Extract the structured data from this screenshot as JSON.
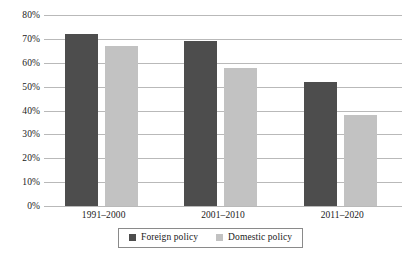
{
  "chart_data": {
    "type": "bar",
    "title": "",
    "subtitle": "",
    "xlabel": "",
    "ylabel": "",
    "categories": [
      "1991–2000",
      "2001–2010",
      "2011–2020"
    ],
    "series": [
      {
        "name": "Foreign policy",
        "values": [
          72,
          69,
          52
        ],
        "color": "#4d4d4d"
      },
      {
        "name": "Domestic policy",
        "values": [
          67,
          58,
          38
        ],
        "color": "#c2c2c2"
      }
    ],
    "ylim": [
      0,
      80
    ],
    "ytick_values": [
      0,
      10,
      20,
      30,
      40,
      50,
      60,
      70,
      80
    ],
    "ytick_labels": [
      "0%",
      "10%",
      "20%",
      "30%",
      "40%",
      "50%",
      "60%",
      "70%",
      "80%"
    ],
    "grid": true,
    "grid_axis": "y",
    "legend_position": "bottom",
    "legend_border": true,
    "value_suffix": "%",
    "background_color": "#ffffff",
    "gridline_color": "#b9b9b9"
  },
  "legend": {
    "items": [
      {
        "label": "Foreign policy",
        "swatch": "legend-swatch-foreign-policy"
      },
      {
        "label": "Domestic policy",
        "swatch": "legend-swatch-domestic-policy"
      }
    ]
  }
}
